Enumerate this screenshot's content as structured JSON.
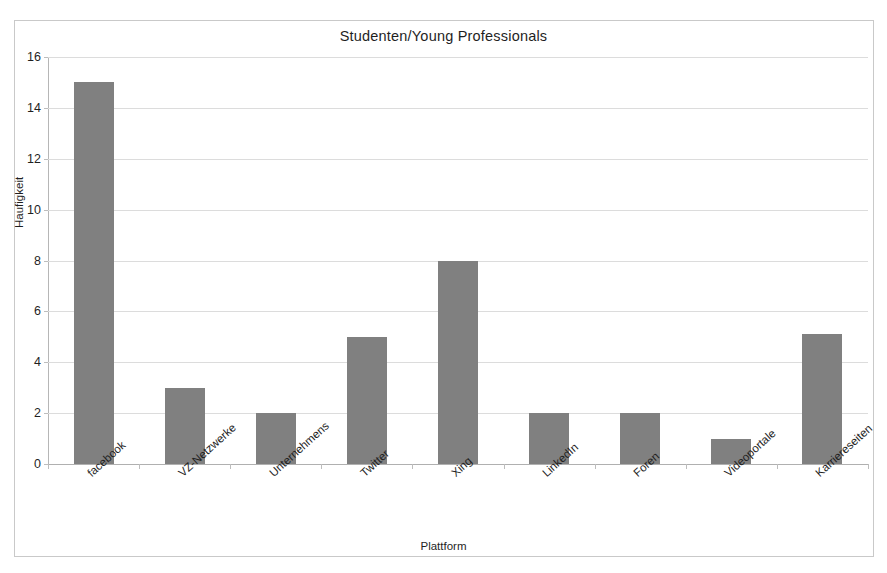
{
  "chart_data": {
    "type": "bar",
    "title": "Studenten/Young Professionals",
    "xlabel": "Plattform",
    "ylabel": "Haufigkeit",
    "categories": [
      "facebook",
      "VZ-Netzwerke",
      "Unternehmens",
      "Twitter",
      "Xing",
      "LinkedIn",
      "Foren",
      "Videoportale",
      "Karriereseiten"
    ],
    "values": [
      15,
      3,
      2,
      5,
      8,
      2,
      2,
      1,
      5.1
    ],
    "ylim": [
      0,
      16
    ],
    "ytick_labels": [
      "0",
      "2",
      "4",
      "6",
      "8",
      "10",
      "12",
      "14",
      "16"
    ],
    "ytick_values": [
      0,
      2,
      4,
      6,
      8,
      10,
      12,
      14,
      16
    ],
    "grid": true,
    "legend": false,
    "bar_color": "#808080",
    "grid_color": "#dcdcdc",
    "axis_color": "#b6b6b6",
    "frame_color": "#c9c9c9",
    "background": "#ffffff"
  }
}
